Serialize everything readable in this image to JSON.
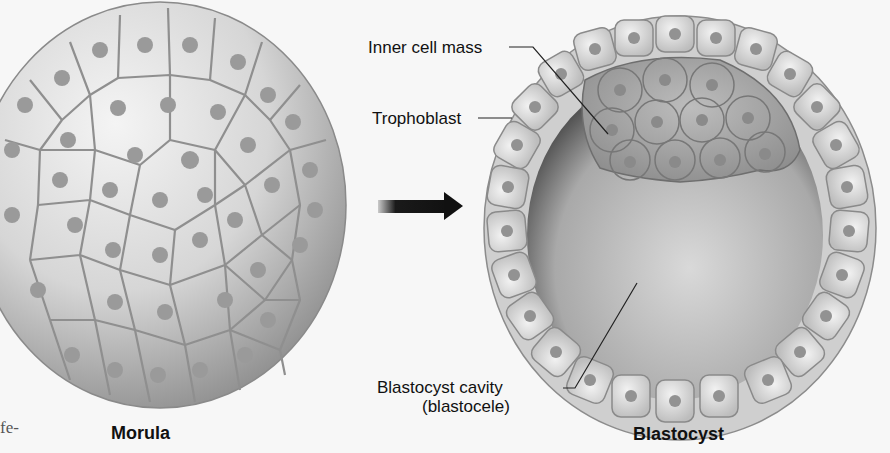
{
  "figure": {
    "stages": [
      {
        "id": "morula",
        "caption": "Morula"
      },
      {
        "id": "blastocyst",
        "caption": "Blastocyst"
      }
    ],
    "arrow": {
      "direction": "right",
      "meaning": "develops into"
    },
    "labels": {
      "inner_cell_mass": "Inner cell mass",
      "trophoblast": "Trophoblast",
      "blastocyst_cavity_line1": "Blastocyst cavity",
      "blastocyst_cavity_line2": "(blastocele)"
    },
    "edge_text": "fe-"
  }
}
